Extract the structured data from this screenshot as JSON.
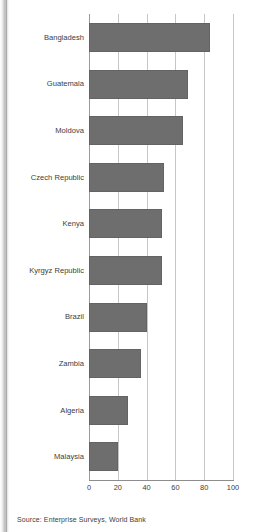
{
  "figure": {
    "source_note": "Source: Enterprise Surveys, World Bank"
  },
  "chart_data": {
    "type": "bar",
    "orientation": "horizontal",
    "title": "",
    "xlabel": "",
    "ylabel": "",
    "xlim": [
      0,
      100
    ],
    "xticks": [
      0,
      20,
      40,
      60,
      80,
      100
    ],
    "xtick_labels": [
      "0",
      "20",
      "40",
      "60",
      "80",
      "100"
    ],
    "grid": "vertical",
    "legend": "none",
    "bar_color": "#6e6e6e",
    "categories": [
      "Bangladesh",
      "Guatemala",
      "Moldova",
      "Czech Republic",
      "Kenya",
      "Kyrgyz Republic",
      "Brazil",
      "Zambia",
      "Algeria",
      "Malaysia"
    ],
    "values": [
      84,
      69,
      65,
      52,
      51,
      51,
      40,
      36,
      27,
      20
    ]
  }
}
